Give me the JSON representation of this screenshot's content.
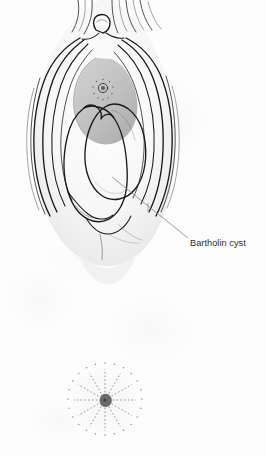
{
  "figure": {
    "kind": "medical-illustration",
    "background_color": "#fdfdfd",
    "width": 266,
    "height": 456
  },
  "annotations": {
    "labels": [
      {
        "id": "bartholin-cyst",
        "text": "Bartholin cyst",
        "text_x": 190,
        "text_y": 246,
        "font_size": 9.2,
        "color": "#2b2b2b",
        "leader": {
          "from_x": 112,
          "from_y": 177,
          "to_x": 188,
          "to_y": 238,
          "color": "#8c8c8c"
        }
      }
    ]
  },
  "structures": {
    "cyst": {
      "name": "Bartholin cyst",
      "fill_light": "#fdfdfd",
      "fill_shade": "#e3e3e3",
      "outline": "#1a1a1a"
    },
    "vestibule_mass": {
      "name": "vestibule",
      "fill_light": "#d2d2d2",
      "fill_shade": "#a9a9a9",
      "outline": "#1a1a1a"
    },
    "labia": {
      "name": "labia majora and minora",
      "fill": "#fbfbfb",
      "outline": "#1a1a1a"
    },
    "urethral_opening": {
      "name": "urethral opening",
      "center_x": 103,
      "center_y": 88,
      "radius": 3.4,
      "fill": "#6e6e6e"
    },
    "anus": {
      "name": "anus",
      "center_x": 105,
      "center_y": 400,
      "radius": 38,
      "fill": "#6a6a6a",
      "spoke_count": 12
    }
  },
  "palette": {
    "ink": "#1a1a1a",
    "mid_gray": "#8c8c8c",
    "light_gray": "#d2d2d2",
    "paper": "#fdfdfd"
  }
}
